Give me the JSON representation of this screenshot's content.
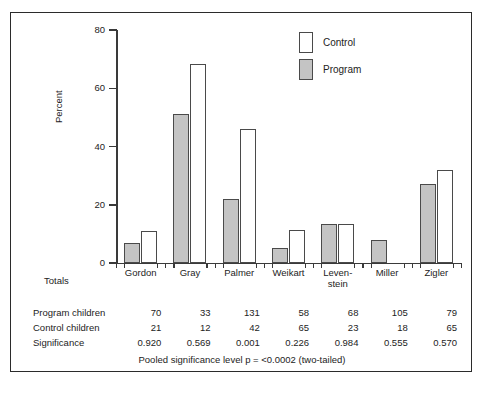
{
  "chart_data": {
    "type": "bar",
    "title": "",
    "xlabel": "",
    "ylabel": "Percent",
    "ylim": [
      0,
      80
    ],
    "yticks": [
      0,
      20,
      40,
      60,
      80
    ],
    "ytick_labels": [
      "0",
      "20",
      "40",
      "60",
      "80"
    ],
    "grid": false,
    "legend_position": "top-right",
    "categories": [
      "Gordon",
      "Gray",
      "Palmer",
      "Weikart",
      "Leven-stein",
      "Miller",
      "Zigler"
    ],
    "category_lines": [
      {
        "line1": "Gordon",
        "line2": ""
      },
      {
        "line1": "Gray",
        "line2": ""
      },
      {
        "line1": "Palmer",
        "line2": ""
      },
      {
        "line1": "Weikart",
        "line2": ""
      },
      {
        "line1": "Leven-",
        "line2": "stein"
      },
      {
        "line1": "Miller",
        "line2": ""
      },
      {
        "line1": "Zigler",
        "line2": ""
      }
    ],
    "series": [
      {
        "name": "Program",
        "color": "#c4c4c4",
        "values": [
          7,
          51,
          22,
          5,
          13.5,
          8,
          27
        ]
      },
      {
        "name": "Control",
        "color": "#ffffff",
        "values": [
          11,
          68.5,
          46,
          11.5,
          13.5,
          null,
          32
        ]
      }
    ]
  },
  "legend": {
    "entries": [
      {
        "label": "Control",
        "swatch": "control"
      },
      {
        "label": "Program",
        "swatch": "program"
      }
    ]
  },
  "axis": {
    "y_title": "Percent",
    "y_tick_labels": [
      "80",
      "60",
      "40",
      "20",
      "0"
    ]
  },
  "table": {
    "totals_label": "Totals",
    "rows": [
      {
        "label": "Program children",
        "values": [
          "70",
          "33",
          "131",
          "58",
          "68",
          "105",
          "79"
        ]
      },
      {
        "label": "Control children",
        "values": [
          "21",
          "12",
          "42",
          "65",
          "23",
          "18",
          "65"
        ]
      },
      {
        "label": "Significance",
        "values": [
          "0.920",
          "0.569",
          "0.001",
          "0.226",
          "0.984",
          "0.555",
          "0.570"
        ]
      }
    ]
  },
  "footer": {
    "note": "Pooled significance level p  =  <0.0002 (two-tailed)"
  }
}
